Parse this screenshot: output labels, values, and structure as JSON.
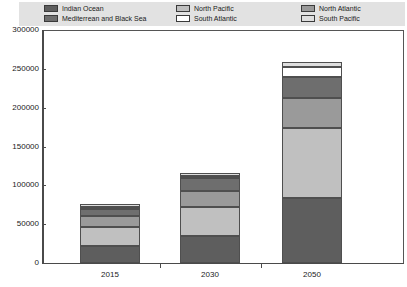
{
  "legend": {
    "columns": [
      [
        {
          "label": "Indian Ocean",
          "color": "#5e5e5e"
        },
        {
          "label": "Mediterrean and Black Sea",
          "color": "#6e6e6e"
        }
      ],
      [
        {
          "label": "North Pacific",
          "color": "#c0c0c0"
        },
        {
          "label": "South Atlantic",
          "color": "#ffffff"
        }
      ],
      [
        {
          "label": "North Atlantic",
          "color": "#9a9a9a"
        },
        {
          "label": "South Pacific",
          "color": "#dedede"
        }
      ]
    ]
  },
  "axes": {
    "y_ticks": [
      "300000",
      "250000",
      "200000",
      "150000",
      "100000",
      "50000",
      "0"
    ],
    "x_ticks": [
      "2015",
      "2030",
      "2050"
    ]
  },
  "chart_data": {
    "type": "bar",
    "subtype": "stacked-vertical",
    "title": "",
    "subtitle": "",
    "xlabel": "",
    "ylabel": "",
    "categories": [
      "2015",
      "2030",
      "2050"
    ],
    "ylim": [
      0,
      300000
    ],
    "y_tick_interval": 50000,
    "y_tick_values": [
      0,
      50000,
      100000,
      150000,
      200000,
      250000,
      300000
    ],
    "grid": false,
    "legend_position": "top",
    "stack_order_bottom_to_top": [
      "Indian Ocean",
      "North Pacific",
      "North Atlantic",
      "Mediterrean and Black Sea",
      "South Atlantic",
      "South Pacific"
    ],
    "series": [
      {
        "name": "Indian Ocean",
        "color": "#5e5e5e",
        "values": [
          22000,
          35000,
          84000
        ]
      },
      {
        "name": "North Pacific",
        "color": "#c0c0c0",
        "values": [
          24000,
          37000,
          90000
        ]
      },
      {
        "name": "North Atlantic",
        "color": "#9a9a9a",
        "values": [
          14000,
          21000,
          38000
        ]
      },
      {
        "name": "Mediterrean and Black Sea",
        "color": "#6e6e6e",
        "values": [
          10000,
          16500,
          28000
        ]
      },
      {
        "name": "South Atlantic",
        "color": "#ffffff",
        "values": [
          2500,
          3000,
          12000
        ]
      },
      {
        "name": "South Pacific",
        "color": "#dedede",
        "values": [
          3500,
          4000,
          7000
        ]
      }
    ],
    "totals": [
      76000,
      116500,
      259000
    ],
    "annotations": []
  },
  "colors": {
    "legend_background": "#e2e2e2",
    "plot_background": "#ffffff",
    "axis": "#4a4a4a",
    "frame": "#555555",
    "bar_outline": "#4f4f4f",
    "text": "#1a1a1a"
  }
}
